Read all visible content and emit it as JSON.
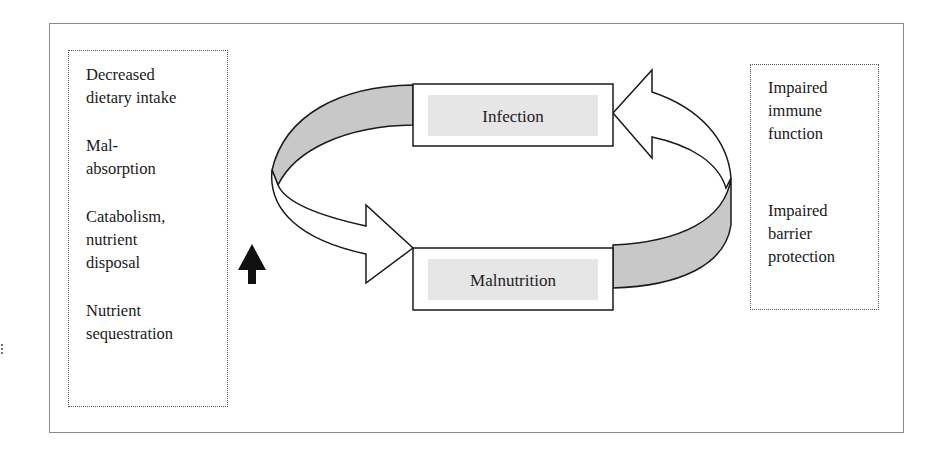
{
  "diagram": {
    "type": "cycle",
    "nodes": {
      "infection": {
        "label": "Infection"
      },
      "malnutrition": {
        "label": "Malnutrition"
      }
    },
    "edges": [
      {
        "from": "malnutrition",
        "to": "infection",
        "direction": "clockwise-right"
      },
      {
        "from": "infection",
        "to": "malnutrition",
        "direction": "counterclockwise-left"
      }
    ],
    "left_factors": [
      "Decreased\ndietary intake",
      "Mal-\nabsorption",
      "Catabolism,\nnutrient\ndisposal",
      "Nutrient\nsequestration"
    ],
    "right_factors": [
      "Impaired\nimmune\nfunction",
      "Impaired\nbarrier\nprotection"
    ],
    "indicator": {
      "icon": "up-arrow-icon",
      "meaning": "increase"
    },
    "colors": {
      "ribbon_shade": "#c8c8c8",
      "label_bg": "#e6e6e6",
      "stroke": "#1a1a1a",
      "frame": "#8c8c8c"
    }
  }
}
